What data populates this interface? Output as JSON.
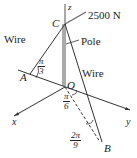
{
  "diagram": {
    "type": "3d-statics-pole-with-wires",
    "force_label": "2500 N",
    "points": {
      "C": "C",
      "A": "A",
      "O": "O",
      "B": "B"
    },
    "axes": {
      "x": "x",
      "y": "y",
      "z": "z"
    },
    "labels": {
      "wire_left": "Wire",
      "wire_right": "Wire",
      "pole": "Pole"
    },
    "angles": {
      "at_A": {
        "num": "π",
        "den": "3"
      },
      "at_O": {
        "num": "π",
        "den": "6"
      },
      "at_B": {
        "num": "2π",
        "den": "9"
      }
    }
  }
}
